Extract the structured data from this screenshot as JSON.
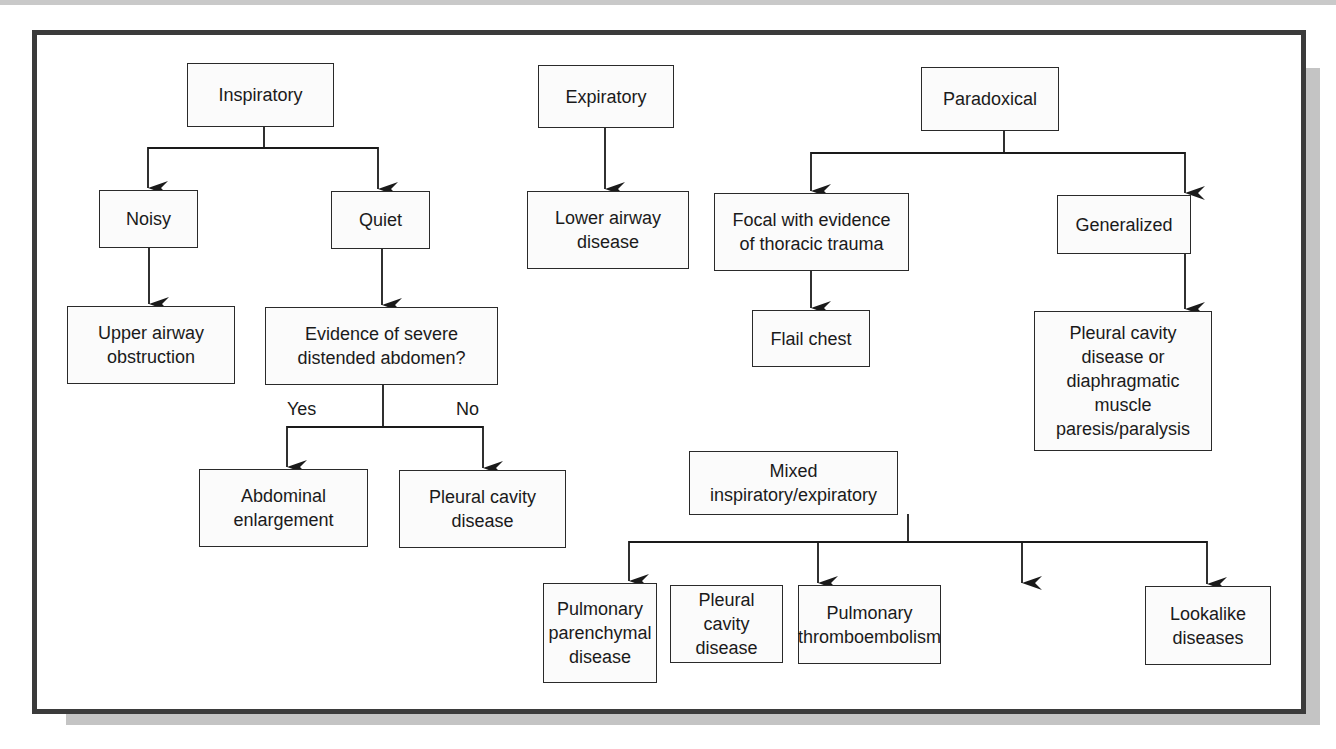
{
  "diagram": {
    "type": "flowchart",
    "title": "",
    "nodes": {
      "inspiratory": "Inspiratory",
      "noisy": "Noisy",
      "quiet": "Quiet",
      "upper_airway": "Upper airway obstruction",
      "evidence": "Evidence of severe distended abdomen?",
      "abdominal": "Abdominal enlargement",
      "pleural_left": "Pleural cavity disease",
      "expiratory": "Expiratory",
      "lower_airway": "Lower airway disease",
      "paradoxical": "Paradoxical",
      "focal": "Focal with evidence of thoracic trauma",
      "generalized": "Generalized",
      "flail": "Flail chest",
      "pleural_diaphragm": "Pleural cavity disease or diaphragmatic muscle paresis/paralysis",
      "mixed": "Mixed inspiratory/expiratory",
      "pulmonary_parenchymal": "Pulmonary parenchymal disease",
      "pleural_bottom": "Pleural cavity disease",
      "thromboembolism": "Pulmonary thromboembolism",
      "lookalike": "Lookalike diseases"
    },
    "edge_labels": {
      "yes": "Yes",
      "no": "No"
    },
    "edges": [
      {
        "from": "inspiratory",
        "to": "noisy"
      },
      {
        "from": "inspiratory",
        "to": "quiet"
      },
      {
        "from": "noisy",
        "to": "upper_airway"
      },
      {
        "from": "quiet",
        "to": "evidence"
      },
      {
        "from": "evidence",
        "to": "abdominal",
        "label": "Yes"
      },
      {
        "from": "evidence",
        "to": "pleural_left",
        "label": "No"
      },
      {
        "from": "expiratory",
        "to": "lower_airway"
      },
      {
        "from": "paradoxical",
        "to": "focal"
      },
      {
        "from": "paradoxical",
        "to": "generalized"
      },
      {
        "from": "focal",
        "to": "flail"
      },
      {
        "from": "generalized",
        "to": "pleural_diaphragm"
      },
      {
        "from": "mixed",
        "to": "pulmonary_parenchymal"
      },
      {
        "from": "mixed",
        "to": "pleural_bottom"
      },
      {
        "from": "mixed",
        "to": "thromboembolism"
      },
      {
        "from": "mixed",
        "to": "lookalike"
      }
    ],
    "colors": {
      "frame_border": "#3b3b3b",
      "shadow": "#c4c4c4",
      "box_border": "#2a2a2a",
      "box_fill": "#fbfbfb",
      "text": "#1a1a1a"
    }
  }
}
